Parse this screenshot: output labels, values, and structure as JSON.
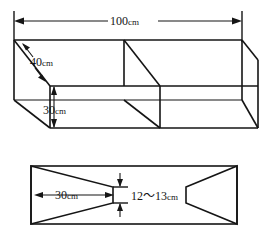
{
  "figure": {
    "ink_color": "#151515",
    "background_color": "#ffffff",
    "views": [
      {
        "name": "perspective-box-view",
        "description": "Open-top rectangular box in oblique perspective with one internal divider panel",
        "dimensions": [
          {
            "name": "length",
            "value": "100",
            "unit": "cm",
            "label": "100cm",
            "orientation": "horizontal",
            "position": "top"
          },
          {
            "name": "depth",
            "value": "40",
            "unit": "cm",
            "label": "40cm",
            "orientation": "diagonal",
            "position": "left"
          },
          {
            "name": "height",
            "value": "30",
            "unit": "cm",
            "label": "30cm",
            "orientation": "vertical",
            "position": "front-left"
          }
        ]
      },
      {
        "name": "plan-trapezoid-view",
        "description": "Plan view showing two mirrored trapezoids inside a rectangle with a narrow central gap",
        "dimensions": [
          {
            "name": "trapezoid-base",
            "value": "30",
            "unit": "cm",
            "label": "30cm",
            "orientation": "horizontal",
            "position": "left-trapezoid"
          },
          {
            "name": "center-gap",
            "value": "12~13",
            "unit": "cm",
            "label": "12～13cm",
            "orientation": "vertical",
            "position": "center"
          }
        ]
      }
    ],
    "labels": {
      "length_value": "100",
      "length_unit": "cm",
      "depth_value": "40",
      "depth_unit": "cm",
      "height_value": "30",
      "height_unit": "cm",
      "base_value": "30",
      "base_unit": "cm",
      "gap_value": "12～13",
      "gap_unit": "cm"
    }
  }
}
